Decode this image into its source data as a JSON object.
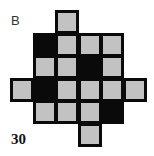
{
  "panel_label": "B",
  "figure_number": "30",
  "colors": {
    "gray": "#c2c2c2",
    "black": "#0a0a0a"
  },
  "grid": {
    "cols": 6,
    "rows": 6,
    "legend": {
      "G": "gray square",
      "B": "black square",
      ".": "empty"
    },
    "pattern": [
      "..G...",
      ".BGGG.",
      ".GGBG.",
      "GBGGGG",
      ".GGGB.",
      "...G.."
    ]
  }
}
